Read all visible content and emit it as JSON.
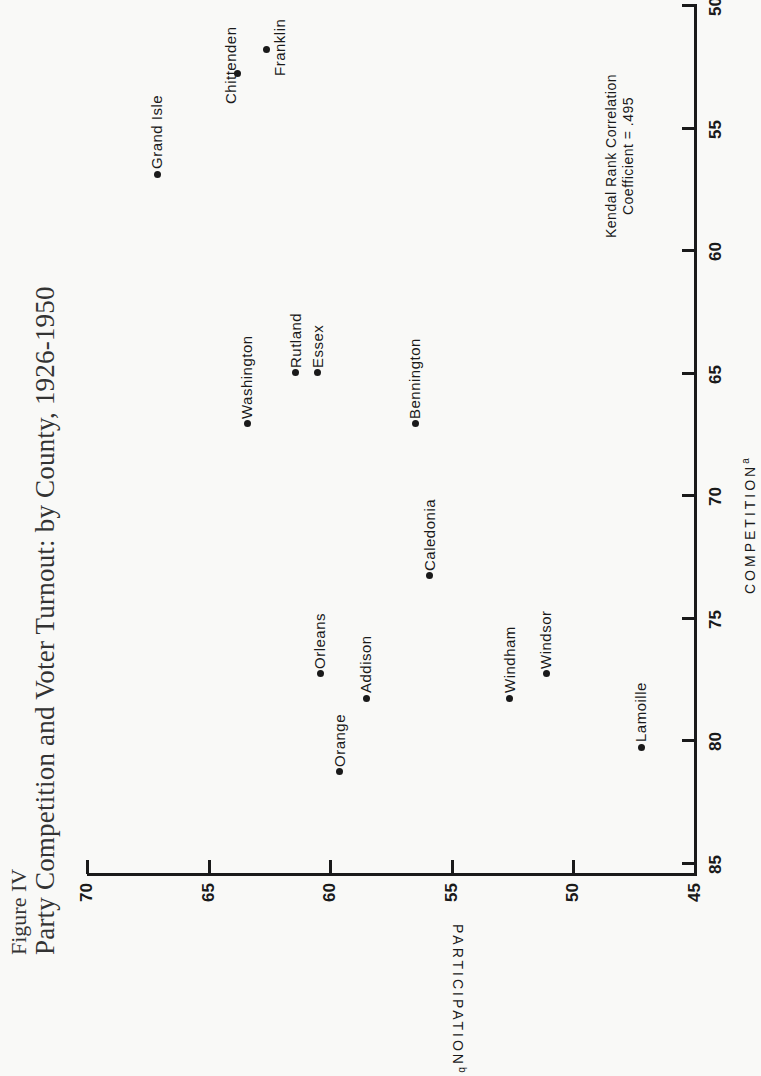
{
  "figure": {
    "label": "Figure IV",
    "title": "Party Competition and Voter Turnout: by County, 1926-1950"
  },
  "note": {
    "line1": "Kendal Rank Correlation",
    "line2": "Coefficient = .495"
  },
  "axes": {
    "participation": {
      "label": "PARTICIPATION",
      "superscript": "b",
      "ticks": [
        "70",
        "65",
        "60",
        "55",
        "50",
        "45"
      ]
    },
    "competition": {
      "label": "COMPETITION",
      "superscript": "a",
      "ticks": [
        "50",
        "55",
        "60",
        "65",
        "70",
        "75",
        "80",
        "85"
      ]
    }
  },
  "chart_data": {
    "type": "scatter",
    "title": "Party Competition and Voter Turnout: by County, 1926-1950",
    "subtitle": "Figure IV",
    "xlabel": "COMPETITION (a)",
    "ylabel": "PARTICIPATION (b)",
    "xlim": [
      85,
      50
    ],
    "ylim": [
      45,
      70
    ],
    "x_ticks": [
      85,
      80,
      75,
      70,
      65,
      60,
      55,
      50
    ],
    "y_ticks": [
      45,
      50,
      55,
      60,
      65,
      70
    ],
    "grid": false,
    "orientation": "rotated 90deg counter-clockwise on page",
    "annotation": "Kendal Rank Correlation Coefficient = .495",
    "points": [
      {
        "label": "Grand Isle",
        "competition": 56.9,
        "participation": 67.1
      },
      {
        "label": "Chittenden",
        "competition": 52.8,
        "participation": 63.8
      },
      {
        "label": "Franklin",
        "competition": 51.8,
        "participation": 62.6
      },
      {
        "label": "Washington",
        "competition": 67.1,
        "participation": 63.4
      },
      {
        "label": "Rutland",
        "competition": 65.0,
        "participation": 61.4
      },
      {
        "label": "Essex",
        "competition": 65.0,
        "participation": 60.5
      },
      {
        "label": "Bennington",
        "competition": 67.1,
        "participation": 56.5
      },
      {
        "label": "Caledonia",
        "competition": 73.3,
        "participation": 55.9
      },
      {
        "label": "Orleans",
        "competition": 77.3,
        "participation": 60.4
      },
      {
        "label": "Addison",
        "competition": 78.3,
        "participation": 58.5
      },
      {
        "label": "Orange",
        "competition": 81.3,
        "participation": 59.6
      },
      {
        "label": "Windham",
        "competition": 78.3,
        "participation": 52.6
      },
      {
        "label": "Windsor",
        "competition": 77.3,
        "participation": 51.1
      },
      {
        "label": "Lamoille",
        "competition": 80.3,
        "participation": 47.2
      }
    ]
  }
}
